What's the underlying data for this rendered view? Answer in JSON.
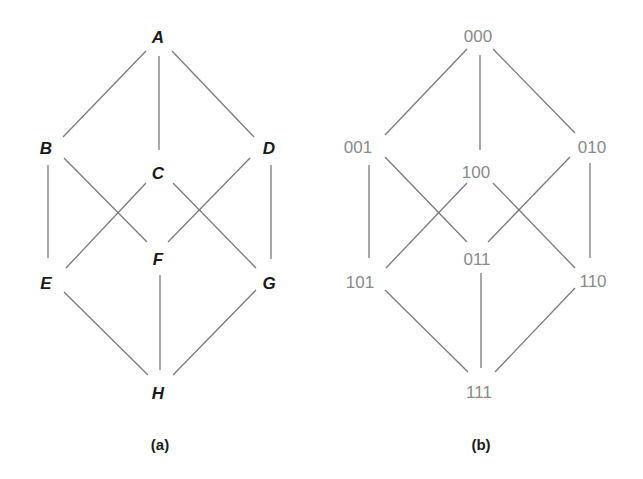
{
  "figure": {
    "panel_a": {
      "caption": "(a)",
      "nodes": {
        "A": "A",
        "B": "B",
        "C": "C",
        "D": "D",
        "E": "E",
        "F": "F",
        "G": "G",
        "H": "H"
      },
      "edges": [
        [
          "A",
          "B"
        ],
        [
          "A",
          "C"
        ],
        [
          "A",
          "D"
        ],
        [
          "B",
          "E"
        ],
        [
          "B",
          "F"
        ],
        [
          "C",
          "E"
        ],
        [
          "C",
          "G"
        ],
        [
          "D",
          "F"
        ],
        [
          "D",
          "G"
        ],
        [
          "E",
          "H"
        ],
        [
          "F",
          "H"
        ],
        [
          "G",
          "H"
        ]
      ]
    },
    "panel_b": {
      "caption": "(b)",
      "nodes": {
        "n000": "000",
        "n001": "001",
        "n100": "100",
        "n010": "010",
        "n101": "101",
        "n011": "011",
        "n110": "110",
        "n111": "111"
      },
      "edges": [
        [
          "000",
          "001"
        ],
        [
          "000",
          "100"
        ],
        [
          "000",
          "010"
        ],
        [
          "001",
          "101"
        ],
        [
          "001",
          "011"
        ],
        [
          "100",
          "101"
        ],
        [
          "100",
          "110"
        ],
        [
          "010",
          "011"
        ],
        [
          "010",
          "110"
        ],
        [
          "101",
          "111"
        ],
        [
          "011",
          "111"
        ],
        [
          "110",
          "111"
        ]
      ]
    }
  }
}
